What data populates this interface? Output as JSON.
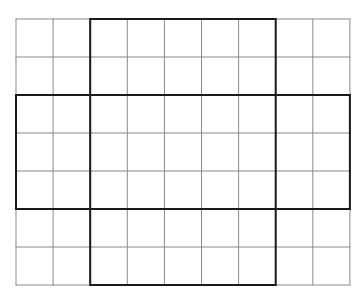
{
  "figure": {
    "type": "grid",
    "columns": 9,
    "rows": 7,
    "origin": {
      "x": 16,
      "y": 19
    },
    "cell_width": 37.1,
    "cell_height": 38,
    "colors": {
      "background": "#ffffff",
      "thin_line": "#8a8a8a",
      "thick_line": "#1a1a1a"
    },
    "thin_line_width": 1,
    "thick_line_width": 2,
    "highlighted_regions": [
      {
        "name": "vertical-band",
        "col_start": 2,
        "col_end": 7,
        "row_start": 0,
        "row_end": 7
      },
      {
        "name": "horizontal-band",
        "col_start": 0,
        "col_end": 9,
        "row_start": 2,
        "row_end": 5
      }
    ]
  }
}
